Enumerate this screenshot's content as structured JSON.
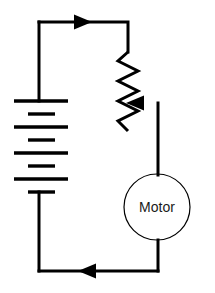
{
  "diagram": {
    "background_color": "#ffffff",
    "line_color": "#000000",
    "text_color": "#1a1a1a"
  },
  "components": {
    "battery": {
      "name": "battery",
      "label": "",
      "cell_count": 4,
      "plates": [
        {
          "type": "long",
          "y": 101,
          "x1": 14,
          "x2": 68
        },
        {
          "type": "short",
          "y": 114,
          "x1": 28,
          "x2": 55
        },
        {
          "type": "long",
          "y": 127,
          "x1": 14,
          "x2": 68
        },
        {
          "type": "short",
          "y": 140,
          "x1": 28,
          "x2": 55
        },
        {
          "type": "long",
          "y": 153,
          "x1": 14,
          "x2": 68
        },
        {
          "type": "short",
          "y": 166,
          "x1": 28,
          "x2": 55
        },
        {
          "type": "long",
          "y": 179,
          "x1": 14,
          "x2": 68
        },
        {
          "type": "short",
          "y": 192,
          "x1": 28,
          "x2": 55
        }
      ]
    },
    "potentiometer": {
      "name": "potentiometer",
      "label": "",
      "zigzag_points": "128,52 118,61 138,71 118,81 138,91 118,101 138,111 118,121 128,131",
      "wiper_arrow_y": 103
    },
    "motor": {
      "name": "motor",
      "label": "Motor",
      "center_x": 157,
      "center_y": 207,
      "radius": 33
    }
  },
  "current_arrows": [
    {
      "name": "top-current-arrow",
      "direction": "right",
      "x": 85,
      "y": 22
    },
    {
      "name": "wiper-current-arrow",
      "direction": "left",
      "x": 139,
      "y": 103
    },
    {
      "name": "bottom-current-arrow",
      "direction": "left",
      "x": 92,
      "y": 271
    }
  ],
  "wires": {
    "top": "M 39,22 L 128,22 L 128,52",
    "battery_top_stub": "M 39,22 L 39,101",
    "battery_bottom_stub": "M 39,192 L 39,271",
    "bottom": "M 39,271 L 158,271",
    "wiper": "M 158,103 L 158,175",
    "motor_bottom": "M 158,240 L 158,271"
  }
}
